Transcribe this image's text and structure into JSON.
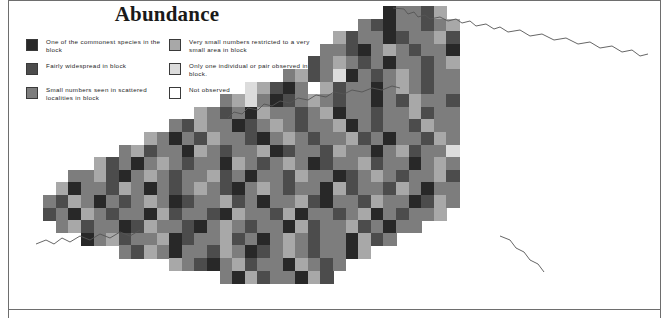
{
  "title": "Abundance",
  "legend": {
    "columns": [
      {
        "items": [
          {
            "label": "One of the commonest species in the block",
            "color": "#282828",
            "name": "legend-swatch-commonest"
          },
          {
            "label": "Fairly widespread in block",
            "color": "#4c4c4c",
            "name": "legend-swatch-fairly-widespread"
          },
          {
            "label": "Small numbers seen in scattered localities in block",
            "color": "#7d7d7d",
            "name": "legend-swatch-small-numbers"
          }
        ]
      },
      {
        "items": [
          {
            "label": "Very small numbers restricted to a very small area in block",
            "color": "#a8a8a8",
            "name": "legend-swatch-very-small-numbers"
          },
          {
            "label": "Only one individual or pair observed in block.",
            "color": "#dcdcdc",
            "name": "legend-swatch-one-individual"
          },
          {
            "label": "Not observed",
            "color": "#ffffff",
            "name": "legend-swatch-not-observed"
          }
        ]
      }
    ]
  },
  "map_data": {
    "type": "grid_choropleth",
    "region": "Kentucky",
    "cell_width": 12.6,
    "cell_height": 12.6,
    "origin_x": 18,
    "origin_y": 6,
    "palette": [
      "#ffffff",
      "#dcdcdc",
      "#a8a8a8",
      "#7d7d7d",
      "#4c4c4c",
      "#282828"
    ],
    "legend_levels": [
      "Not observed",
      "Only one individual or pair observed in block.",
      "Very small numbers restricted to a very small area in block",
      "Small numbers seen in scattered localities in block",
      "Fairly widespread in block",
      "One of the commonest species in the block"
    ],
    "rows": [
      {
        "row": 0,
        "col_start": 29,
        "values": [
          5,
          3,
          3,
          4,
          2
        ]
      },
      {
        "row": 1,
        "col_start": 27,
        "values": [
          3,
          4,
          5,
          3,
          3,
          4,
          3,
          2
        ]
      },
      {
        "row": 2,
        "col_start": 25,
        "values": [
          2,
          4,
          3,
          3,
          5,
          4,
          3,
          3,
          2,
          4
        ]
      },
      {
        "row": 3,
        "col_start": 24,
        "values": [
          3,
          3,
          4,
          5,
          3,
          2,
          3,
          4,
          3,
          3,
          5
        ]
      },
      {
        "row": 4,
        "col_start": 23,
        "values": [
          4,
          3,
          2,
          3,
          4,
          3,
          5,
          3,
          3,
          4,
          3,
          2
        ]
      },
      {
        "row": 5,
        "col_start": 21,
        "values": [
          3,
          2,
          4,
          3,
          1,
          5,
          3,
          4,
          3,
          2,
          3,
          4,
          3,
          3
        ]
      },
      {
        "row": 6,
        "col_start": 18,
        "values": [
          1,
          2,
          4,
          5,
          3,
          0,
          2,
          4,
          3,
          3,
          5,
          3,
          2,
          3,
          4,
          3,
          3
        ]
      },
      {
        "row": 7,
        "col_start": 16,
        "values": [
          3,
          2,
          1,
          3,
          5,
          4,
          3,
          2,
          3,
          4,
          3,
          3,
          5,
          3,
          4,
          2,
          3,
          3,
          4
        ]
      },
      {
        "row": 8,
        "col_start": 14,
        "values": [
          2,
          3,
          4,
          3,
          5,
          2,
          3,
          3,
          4,
          3,
          2,
          5,
          3,
          3,
          4,
          3,
          3,
          2,
          4,
          3,
          3
        ]
      },
      {
        "row": 9,
        "col_start": 12,
        "values": [
          3,
          4,
          2,
          3,
          3,
          5,
          4,
          3,
          2,
          3,
          4,
          3,
          3,
          2,
          5,
          3,
          4,
          3,
          3,
          4,
          2,
          3,
          3
        ]
      },
      {
        "row": 10,
        "col_start": 10,
        "values": [
          2,
          3,
          5,
          3,
          4,
          2,
          3,
          3,
          4,
          5,
          3,
          2,
          3,
          4,
          3,
          3,
          2,
          4,
          3,
          5,
          3,
          3,
          4,
          2,
          3
        ]
      },
      {
        "row": 11,
        "col_start": 8,
        "values": [
          3,
          2,
          4,
          3,
          3,
          5,
          2,
          3,
          4,
          3,
          3,
          2,
          5,
          4,
          3,
          3,
          4,
          2,
          3,
          3,
          5,
          3,
          2,
          4,
          3,
          3,
          1
        ]
      },
      {
        "row": 12,
        "col_start": 6,
        "values": [
          2,
          4,
          3,
          5,
          3,
          2,
          3,
          4,
          3,
          3,
          5,
          2,
          3,
          4,
          3,
          2,
          3,
          5,
          4,
          3,
          3,
          2,
          4,
          3,
          3,
          5,
          3,
          2,
          3
        ]
      },
      {
        "row": 13,
        "col_start": 4,
        "values": [
          3,
          3,
          2,
          4,
          5,
          3,
          2,
          3,
          4,
          3,
          3,
          2,
          4,
          3,
          5,
          3,
          3,
          4,
          2,
          3,
          3,
          5,
          4,
          3,
          2,
          3,
          4,
          3,
          3,
          2,
          4
        ]
      },
      {
        "row": 14,
        "col_start": 3,
        "values": [
          2,
          5,
          3,
          3,
          4,
          2,
          3,
          5,
          3,
          4,
          3,
          2,
          3,
          4,
          5,
          3,
          2,
          3,
          4,
          3,
          3,
          5,
          2,
          4,
          3,
          3,
          4,
          2,
          3,
          5,
          3,
          3
        ]
      },
      {
        "row": 15,
        "col_start": 2,
        "values": [
          3,
          4,
          2,
          3,
          5,
          3,
          4,
          3,
          2,
          3,
          5,
          4,
          3,
          3,
          2,
          4,
          3,
          5,
          3,
          3,
          2,
          4,
          5,
          3,
          3,
          4,
          2,
          3,
          3,
          5,
          4,
          2,
          3
        ]
      },
      {
        "row": 16,
        "col_start": 2,
        "values": [
          4,
          3,
          5,
          2,
          3,
          4,
          3,
          3,
          5,
          2,
          4,
          3,
          3,
          4,
          5,
          2,
          3,
          3,
          4,
          2,
          5,
          3,
          3,
          4,
          3,
          2,
          5,
          3,
          4,
          3,
          3,
          2
        ]
      },
      {
        "row": 17,
        "col_start": 3,
        "values": [
          3,
          2,
          4,
          3,
          3,
          5,
          4,
          2,
          3,
          3,
          4,
          5,
          3,
          2,
          3,
          4,
          3,
          3,
          5,
          2,
          4,
          3,
          3,
          2,
          4,
          3,
          5,
          3,
          3
        ]
      },
      {
        "row": 18,
        "col_start": 5,
        "values": [
          5,
          3,
          2,
          4,
          3,
          3,
          2,
          5,
          4,
          3,
          3,
          2,
          4,
          3,
          5,
          3,
          2,
          3,
          4,
          3,
          3,
          5,
          2,
          4,
          3
        ]
      },
      {
        "row": 19,
        "col_start": 8,
        "values": [
          3,
          4,
          2,
          3,
          5,
          3,
          3,
          4,
          2,
          3,
          5,
          4,
          3,
          2,
          3,
          4,
          3,
          3,
          5,
          2
        ]
      },
      {
        "row": 20,
        "col_start": 12,
        "values": [
          2,
          3,
          4,
          5,
          3,
          2,
          4,
          3,
          3,
          5,
          2,
          3,
          4,
          3
        ]
      },
      {
        "row": 21,
        "col_start": 16,
        "values": [
          3,
          5,
          2,
          4,
          3,
          3,
          5,
          2,
          4
        ]
      }
    ]
  }
}
